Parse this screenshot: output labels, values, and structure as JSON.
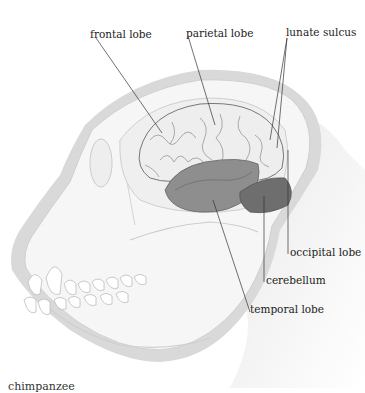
{
  "diagram": {
    "labels": {
      "frontal_lobe": "frontal lobe",
      "parietal_lobe": "parietal lobe",
      "lunate_sulcus": "lunate sulcus",
      "occipital_lobe": "occipital lobe",
      "cerebellum": "cerebellum",
      "temporal_lobe": "temporal lobe"
    },
    "caption": "chimpanzee",
    "colors": {
      "skull_outline": "#d8d8d8",
      "skull_fill": "#f4f4f4",
      "brain_light": "#ececec",
      "temporal_lobe": "#8c8c8c",
      "cerebellum": "#6e6e6e",
      "leader_line": "#333333"
    }
  }
}
